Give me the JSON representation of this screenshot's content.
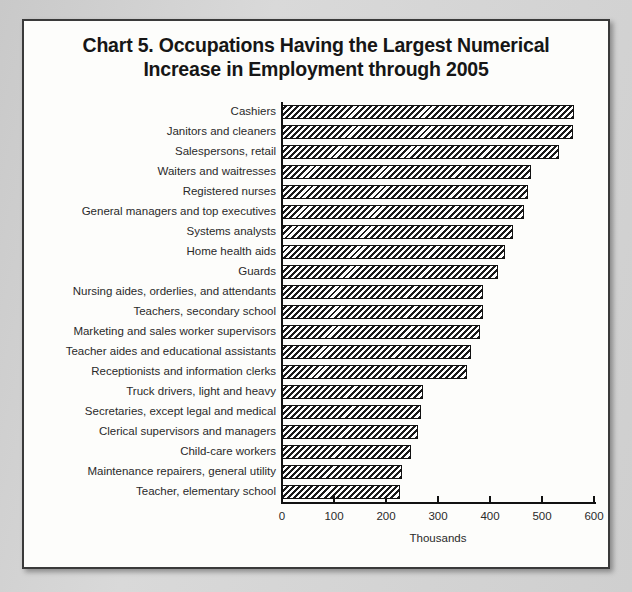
{
  "chart_data": {
    "type": "bar",
    "orientation": "horizontal",
    "title": "Chart 5. Occupations Having the Largest Numerical Increase in Employment through 2005",
    "title_lines": [
      "Chart 5. Occupations Having the Largest Numerical",
      "Increase in Employment through 2005"
    ],
    "xlabel": "Thousands",
    "ylabel": "",
    "xlim": [
      0,
      600
    ],
    "xticks": [
      0,
      100,
      200,
      300,
      400,
      500,
      600
    ],
    "xtick_labels": [
      "0",
      "100",
      "200",
      "300",
      "400",
      "500",
      "600"
    ],
    "grid": false,
    "legend": false,
    "bar_fill": "diagonal-hatch",
    "bar_color": "#1a1a1a",
    "categories": [
      "Cashiers",
      "Janitors and cleaners",
      "Salespersons, retail",
      "Waiters and waitresses",
      "Registered nurses",
      "General managers and top executives",
      "Systems analysts",
      "Home health aids",
      "Guards",
      "Nursing aides, orderlies, and attendants",
      "Teachers, secondary school",
      "Marketing and sales worker supervisors",
      "Teacher aides and educational assistants",
      "Receptionists and information clerks",
      "Truck drivers, light and heavy",
      "Secretaries, except legal and medical",
      "Clerical supervisors and managers",
      "Child-care workers",
      "Maintenance repairers, general utility",
      "Teacher, elementary school"
    ],
    "values": [
      562,
      559,
      532,
      479,
      473,
      466,
      445,
      428,
      415,
      387,
      386,
      380,
      364,
      355,
      271,
      267,
      261,
      248,
      231,
      226
    ]
  },
  "frame": {
    "page_background": "#cfcfcf",
    "paper_background": "#fdfdfb",
    "border_color": "#3a3a3a"
  }
}
